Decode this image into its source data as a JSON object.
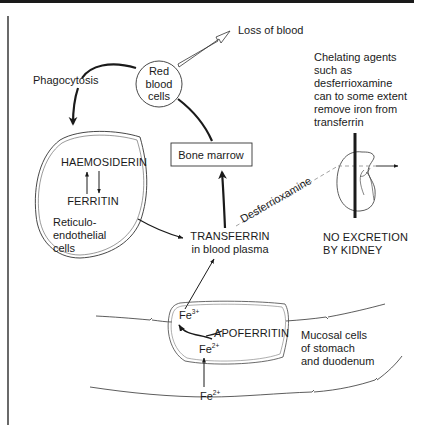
{
  "diagram": {
    "nodes": {
      "red_blood_cells": [
        "Red",
        "blood",
        "cells"
      ],
      "loss_of_blood": "Loss of blood",
      "phagocytosis": "Phagocytosis",
      "bone_marrow": "Bone marrow",
      "haemosiderin": "HAEMOSIDERIN",
      "ferritin": "FERRITIN",
      "reticuloendothelial": [
        "Reticulo-",
        "endothelial",
        "cells"
      ],
      "transferrin": [
        "TRANSFERRIN",
        "in blood plasma"
      ],
      "desferrioxamine": "Desferrioxamine",
      "chelating_note": [
        "Chelating agents",
        "such as",
        "desferrioxamine",
        "can to some extent",
        "remove iron from",
        "transferrin"
      ],
      "no_excretion": [
        "NO EXCRETION",
        "BY KIDNEY"
      ],
      "apoferritin": "APOFERRITIN",
      "mucosal": [
        "Mucosal cells",
        "of stomach",
        "and duodenum"
      ],
      "fe3": {
        "base": "Fe",
        "charge": "3+"
      },
      "fe2_inner": {
        "base": "Fe",
        "charge": "2+"
      },
      "fe2_outer": {
        "base": "Fe",
        "charge": "2+"
      }
    },
    "edges": [
      {
        "from": "red_blood_cells",
        "to": "loss_of_blood",
        "style": "hollow-arrow"
      },
      {
        "from": "red_blood_cells",
        "to": "reticuloendothelial",
        "label": "Phagocytosis",
        "style": "bold-arrow"
      },
      {
        "from": "haemosiderin",
        "to": "ferritin",
        "style": "bidirectional"
      },
      {
        "from": "reticuloendothelial",
        "to": "transferrin",
        "style": "arrow"
      },
      {
        "from": "transferrin",
        "to": "bone_marrow",
        "style": "bold-arrow"
      },
      {
        "from": "bone_marrow",
        "to": "red_blood_cells",
        "style": "bold-line"
      },
      {
        "from": "transferrin",
        "to": "kidney",
        "label": "Desferrioxamine",
        "style": "dashed-arrow"
      },
      {
        "from": "fe2_outer",
        "to": "fe2_inner",
        "style": "arrow"
      },
      {
        "from": "fe2_inner",
        "to": "fe3",
        "via": "apoferritin",
        "style": "curved-arrow"
      },
      {
        "from": "fe3",
        "to": "transferrin",
        "style": "arrow"
      }
    ],
    "colors": {
      "ink": "#1a1a1a",
      "background": "#ffffff",
      "dashed": "#8a8a8a"
    }
  }
}
